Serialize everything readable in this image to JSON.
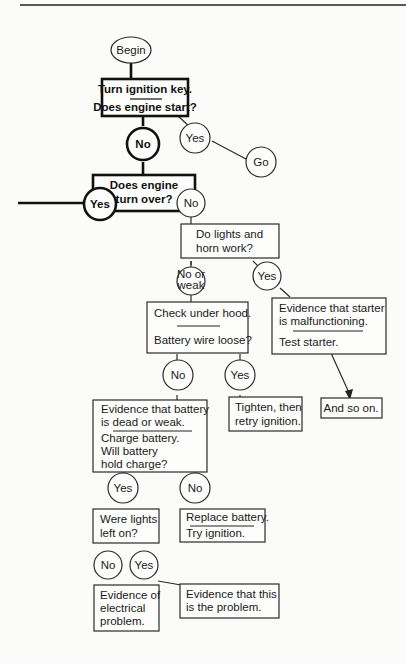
{
  "nodes": {
    "begin": "Begin",
    "turn_key": {
      "line1": "Turn ignition key.",
      "line2": "Does engine start?"
    },
    "start_no": "No",
    "start_yes": "Yes",
    "go": "Go",
    "turn_over": {
      "line1": "Does engine",
      "line2": "turn over?"
    },
    "turn_yes": "Yes",
    "turn_no": "No",
    "lights_horn": {
      "line1": "Do lights and",
      "line2": "horn work?"
    },
    "lights_no_weak": {
      "line1": "No or",
      "line2": "weak"
    },
    "lights_yes": "Yes",
    "check_hood": {
      "line1": "Check under hood.",
      "line2": "Battery wire loose?"
    },
    "starter_evidence": {
      "line1": "Evidence that starter",
      "line2": "is malfunctioning.",
      "line3": "Test starter."
    },
    "wire_no": "No",
    "wire_yes": "Yes",
    "tighten": {
      "line1": "Tighten, then",
      "line2": "retry ignition."
    },
    "and_so_on": "And so on.",
    "battery_evidence": {
      "line1": "Evidence that battery",
      "line2": "is dead or weak.",
      "line3": "Charge battery.",
      "line4": "Will battery",
      "line5": "hold charge?"
    },
    "hold_yes": "Yes",
    "hold_no": "No",
    "replace_battery": {
      "line1": "Replace battery.",
      "line2": "Try ignition."
    },
    "lights_left_on": {
      "line1": "Were lights",
      "line2": "left on?"
    },
    "left_no": "No",
    "left_yes": "Yes",
    "electrical": {
      "line1": "Evidence of",
      "line2": "electrical",
      "line3": "problem."
    },
    "this_problem": {
      "line1": "Evidence that this",
      "line2": "is the problem."
    }
  }
}
